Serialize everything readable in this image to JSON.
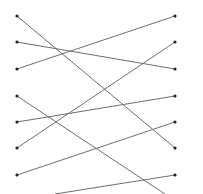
{
  "diagram": {
    "type": "bipartite-matching",
    "line_color": "#6e6e6e",
    "dot_color": "#222222",
    "left_nodes": [
      {
        "id": "L1",
        "x": 17,
        "y": 16
      },
      {
        "id": "L2",
        "x": 17,
        "y": 42
      },
      {
        "id": "L3",
        "x": 17,
        "y": 69
      },
      {
        "id": "L4",
        "x": 17,
        "y": 96
      },
      {
        "id": "L5",
        "x": 17,
        "y": 122
      },
      {
        "id": "L6",
        "x": 17,
        "y": 148
      },
      {
        "id": "L7",
        "x": 17,
        "y": 175
      }
    ],
    "right_nodes": [
      {
        "id": "R1",
        "x": 175,
        "y": 16
      },
      {
        "id": "R2",
        "x": 175,
        "y": 42
      },
      {
        "id": "R3",
        "x": 175,
        "y": 69
      },
      {
        "id": "R4",
        "x": 175,
        "y": 96
      },
      {
        "id": "R5",
        "x": 175,
        "y": 122
      },
      {
        "id": "R6",
        "x": 175,
        "y": 148
      },
      {
        "id": "R7",
        "x": 175,
        "y": 175
      }
    ],
    "edges": [
      {
        "from": "L1",
        "to": "R6",
        "x1": 17,
        "y1": 16,
        "x2": 175,
        "y2": 148
      },
      {
        "from": "L2",
        "to": "R3",
        "x1": 17,
        "y1": 42,
        "x2": 175,
        "y2": 69
      },
      {
        "from": "L3",
        "to": "R1",
        "x1": 17,
        "y1": 69,
        "x2": 175,
        "y2": 16
      },
      {
        "from": "L4",
        "to": "offscreen",
        "x1": 17,
        "y1": 96,
        "x2": 165,
        "y2": 194
      },
      {
        "from": "L5",
        "to": "R4",
        "x1": 17,
        "y1": 122,
        "x2": 175,
        "y2": 96
      },
      {
        "from": "L6",
        "to": "R2",
        "x1": 17,
        "y1": 148,
        "x2": 175,
        "y2": 42
      },
      {
        "from": "L7",
        "to": "R5",
        "x1": 17,
        "y1": 175,
        "x2": 175,
        "y2": 122
      },
      {
        "from": "offscreen",
        "to": "R7",
        "x1": 55,
        "y1": 194,
        "x2": 175,
        "y2": 175
      }
    ]
  }
}
